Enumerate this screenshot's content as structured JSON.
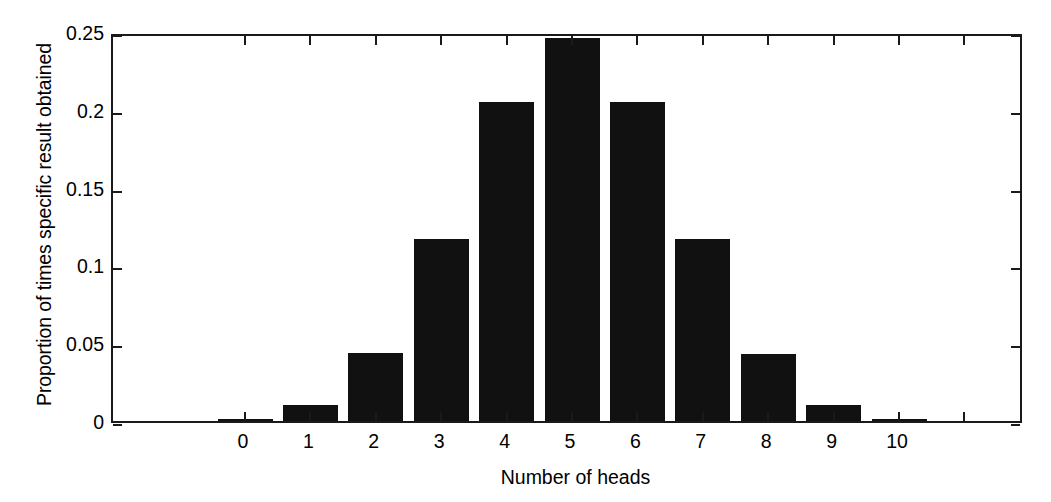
{
  "chart_data": {
    "type": "bar",
    "title": "",
    "xlabel": "Number of heads",
    "ylabel": "Proportion of times specific result obtained",
    "categories": [
      "0",
      "1",
      "2",
      "3",
      "4",
      "5",
      "6",
      "7",
      "8",
      "9",
      "10"
    ],
    "values": [
      0.001,
      0.01,
      0.044,
      0.117,
      0.205,
      0.246,
      0.205,
      0.117,
      0.043,
      0.01,
      0.001
    ],
    "ylim": [
      0,
      0.25
    ],
    "yticks": [
      0,
      0.05,
      0.1,
      0.15,
      0.2,
      0.25
    ],
    "ytick_labels": [
      "0",
      "0.05",
      "0.1",
      "0.15",
      "0.2",
      "0.25"
    ],
    "xlim": [
      -0.5,
      11.5
    ],
    "grid": false,
    "legend": null,
    "bar_color": "#111111",
    "axis_color": "#1a1a1a",
    "background_color": "#ffffff",
    "annotations": []
  }
}
